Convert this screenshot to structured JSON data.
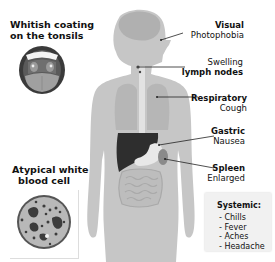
{
  "diagram": {
    "callouts": {
      "tonsils": {
        "title_line1": "Whitish coating",
        "title_line2": "on the  tonsils"
      },
      "blood_cell": {
        "title_line1": "Atypical white",
        "title_line2": "blood cell"
      },
      "visual": {
        "category": "Visual",
        "symptom": "Photophobia"
      },
      "lymph": {
        "symptom": "Swelling",
        "category": "lymph nodes"
      },
      "respiratory": {
        "category": "Respiratory",
        "symptom": "Cough"
      },
      "gastric": {
        "category": "Gastric",
        "symptom": "Nausea"
      },
      "spleen": {
        "category": "Spleen",
        "symptom": "Enlarged"
      }
    },
    "systemic": {
      "heading": "Systemic:",
      "items": [
        "- Chills",
        "- Fever",
        "- Aches",
        "- Headache"
      ]
    },
    "colors": {
      "body": "#c4c4c4",
      "organ_dark": "#2e2e2e",
      "leader_line": "#222222",
      "systemic_bg": "#f1f1f1"
    }
  }
}
